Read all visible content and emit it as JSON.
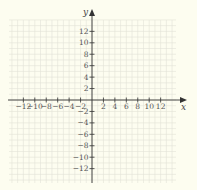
{
  "chart_data": {
    "type": "scatter",
    "title": "",
    "xlabel": "x",
    "ylabel": "y",
    "xlim": [
      -14,
      14
    ],
    "ylim": [
      -14,
      14
    ],
    "grid": true,
    "x_ticks": [
      -12,
      -10,
      -8,
      -6,
      -4,
      -2,
      2,
      4,
      6,
      8,
      10,
      12
    ],
    "y_ticks": [
      12,
      10,
      8,
      6,
      4,
      2,
      -2,
      -4,
      -6,
      -8,
      -10,
      -12
    ],
    "x_tick_labels": [
      "−12",
      "−10",
      "−8",
      "−6",
      "−4",
      "−2",
      "2",
      "4",
      "6",
      "8",
      "10",
      "12"
    ],
    "y_tick_labels": [
      "12",
      "10",
      "8",
      "6",
      "4",
      "2",
      "−2",
      "−4",
      "−6",
      "−8",
      "−10",
      "−12"
    ],
    "series": [],
    "legend": null
  },
  "colors": {
    "background": "#fdfdf0",
    "grid": "#e3e3d6",
    "axis": "#333333"
  }
}
